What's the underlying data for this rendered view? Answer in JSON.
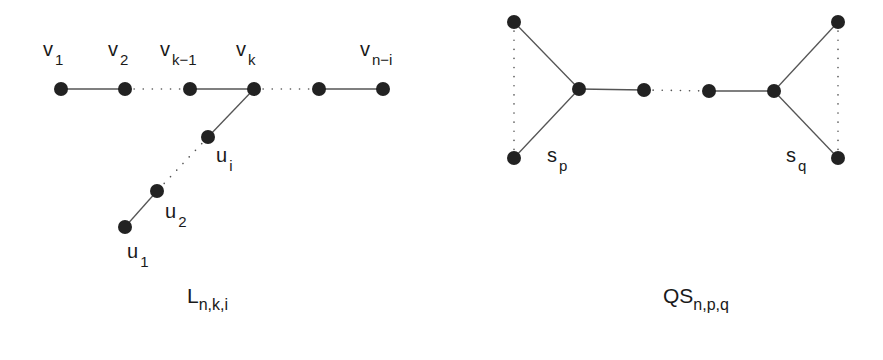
{
  "colors": {
    "background": "#ffffff",
    "node_fill": "#222222",
    "edge": "#555555",
    "dotted": "#555555",
    "text": "#1a1a1a"
  },
  "node_radius": 7,
  "graphs": [
    {
      "id": "L",
      "caption": {
        "main": "L",
        "sub": "n,k,i",
        "x": 187,
        "y": 303
      },
      "nodes": [
        {
          "id": "v1",
          "x": 61,
          "y": 89
        },
        {
          "id": "v2",
          "x": 125,
          "y": 89
        },
        {
          "id": "vk-1",
          "x": 190,
          "y": 89
        },
        {
          "id": "vk",
          "x": 254,
          "y": 89
        },
        {
          "id": "vx",
          "x": 319,
          "y": 89
        },
        {
          "id": "vn-i",
          "x": 383,
          "y": 89
        },
        {
          "id": "ui",
          "x": 208,
          "y": 137
        },
        {
          "id": "u2",
          "x": 157,
          "y": 191
        },
        {
          "id": "u1",
          "x": 125,
          "y": 227
        }
      ],
      "edges": [
        {
          "from": "v1",
          "to": "v2",
          "style": "solid"
        },
        {
          "from": "v2",
          "to": "vk-1",
          "style": "dotted"
        },
        {
          "from": "vk-1",
          "to": "vk",
          "style": "solid"
        },
        {
          "from": "vk",
          "to": "vx",
          "style": "dotted"
        },
        {
          "from": "vx",
          "to": "vn-i",
          "style": "solid"
        },
        {
          "from": "vk",
          "to": "ui",
          "style": "solid"
        },
        {
          "from": "ui",
          "to": "u2",
          "style": "dotted"
        },
        {
          "from": "u2",
          "to": "u1",
          "style": "solid"
        }
      ],
      "labels": [
        {
          "main": "v",
          "sub": "1",
          "x": 43,
          "y": 56
        },
        {
          "main": "v",
          "sub": "2",
          "x": 108,
          "y": 56
        },
        {
          "main": "v",
          "sub": "k−1",
          "x": 160,
          "y": 56
        },
        {
          "main": "v",
          "sub": "k",
          "x": 236,
          "y": 56
        },
        {
          "main": "v",
          "sub": "n−i",
          "x": 360,
          "y": 56
        },
        {
          "main": "u",
          "sub": "i",
          "x": 216,
          "y": 162
        },
        {
          "main": "u",
          "sub": "2",
          "x": 165,
          "y": 218
        },
        {
          "main": "u",
          "sub": "1",
          "x": 127,
          "y": 258
        }
      ]
    },
    {
      "id": "QS",
      "caption": {
        "main": "QS",
        "sub": "n,p,q",
        "x": 663,
        "y": 303
      },
      "nodes": [
        {
          "id": "lt",
          "x": 514,
          "y": 22
        },
        {
          "id": "lb",
          "x": 514,
          "y": 158
        },
        {
          "id": "lh",
          "x": 579,
          "y": 89
        },
        {
          "id": "m1",
          "x": 644,
          "y": 90
        },
        {
          "id": "m2",
          "x": 709,
          "y": 91
        },
        {
          "id": "rh",
          "x": 774,
          "y": 91
        },
        {
          "id": "rt",
          "x": 838,
          "y": 22
        },
        {
          "id": "rb",
          "x": 838,
          "y": 158
        }
      ],
      "edges": [
        {
          "from": "lt",
          "to": "lh",
          "style": "solid"
        },
        {
          "from": "lb",
          "to": "lh",
          "style": "solid"
        },
        {
          "from": "lt",
          "to": "lb",
          "style": "dotted"
        },
        {
          "from": "lh",
          "to": "m1",
          "style": "solid"
        },
        {
          "from": "m1",
          "to": "m2",
          "style": "dotted"
        },
        {
          "from": "m2",
          "to": "rh",
          "style": "solid"
        },
        {
          "from": "rh",
          "to": "rt",
          "style": "solid"
        },
        {
          "from": "rh",
          "to": "rb",
          "style": "solid"
        },
        {
          "from": "rt",
          "to": "rb",
          "style": "dotted"
        }
      ],
      "labels": [
        {
          "main": "s",
          "sub": "p",
          "x": 547,
          "y": 162
        },
        {
          "main": "s",
          "sub": "q",
          "x": 786,
          "y": 162
        }
      ]
    }
  ]
}
